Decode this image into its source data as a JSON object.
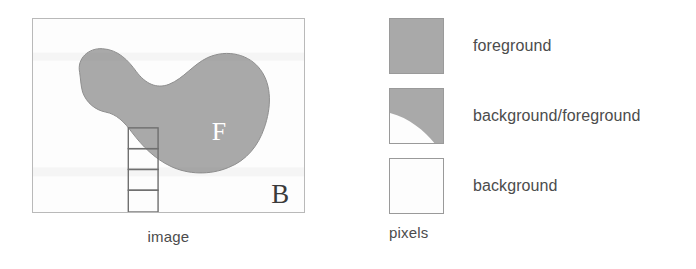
{
  "figure": {
    "panels": {
      "image": {
        "caption": "image",
        "region_labels": {
          "foreground": "F",
          "background": "B"
        },
        "pixel_column": {
          "cells": 4,
          "cell_kinds": [
            "foreground",
            "background/foreground",
            "background",
            "background"
          ]
        }
      },
      "legend": {
        "caption": "pixels",
        "entries": [
          {
            "label": "foreground",
            "swatch": "solid-gray-swatch"
          },
          {
            "label": "background/foreground",
            "swatch": "mixed-gray-white-swatch"
          },
          {
            "label": "background",
            "swatch": "empty-white-swatch"
          }
        ]
      }
    },
    "colors": {
      "foreground_gray": "#a9a9a9",
      "background_white": "#fdfdfd",
      "frame_border": "#b9b9b9",
      "swatch_border": "#9a9a9a",
      "grid_line": "#6f6f6f",
      "text": "#4c4c4c",
      "label_F": "#ffffff",
      "label_B": "#3a3a3a"
    }
  }
}
